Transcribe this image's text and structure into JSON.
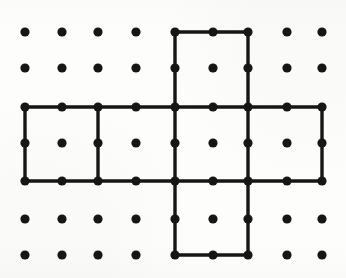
{
  "figure": {
    "caption": "",
    "background_color": "#fdfdfc",
    "ink_color": "#161616"
  },
  "chart_data": {
    "type": "scatter",
    "subtitle": "",
    "xlabel": "",
    "ylabel": "",
    "grid": false,
    "legend_position": "none",
    "xlim": [
      0,
      8
    ],
    "ylim": [
      0,
      6
    ],
    "axis_visible": false,
    "tick_labels_x": [],
    "tick_labels_y": [],
    "lattice": {
      "description": "Regular square lattice of filled round dots, 9 columns by 7 rows",
      "columns": 9,
      "rows": 7,
      "total_dots": 63,
      "dot_radius_px": 4.6,
      "dot_color": "#161616",
      "column_x_px": [
        25,
        62,
        98,
        136,
        175,
        213,
        248,
        287,
        322
      ],
      "row_y_px": [
        32,
        68,
        107,
        143,
        181,
        219,
        255
      ],
      "column_spacing_px": 37,
      "row_spacing_px": 37
    },
    "polygon": {
      "name": "cross-outline",
      "shape": "plus/cross (cube net)",
      "stroke_color": "#161616",
      "stroke_width_px": 3.4,
      "fill": "none",
      "closed": true,
      "vertices_grid": [
        [
          4,
          6
        ],
        [
          6,
          6
        ],
        [
          6,
          4
        ],
        [
          8,
          4
        ],
        [
          8,
          2
        ],
        [
          6,
          2
        ],
        [
          6,
          0
        ],
        [
          4,
          0
        ],
        [
          4,
          2
        ],
        [
          0,
          2
        ],
        [
          0,
          4
        ],
        [
          4,
          4
        ]
      ],
      "vertices_px": [
        [
          175,
          32
        ],
        [
          248,
          32
        ],
        [
          248,
          107
        ],
        [
          322,
          107
        ],
        [
          322,
          181
        ],
        [
          248,
          181
        ],
        [
          248,
          255
        ],
        [
          175,
          255
        ],
        [
          175,
          181
        ],
        [
          25,
          181
        ],
        [
          25,
          107
        ],
        [
          175,
          107
        ]
      ]
    },
    "internal_segments": {
      "description": "Segments dividing the cross into six unit squares",
      "stroke_color": "#161616",
      "stroke_width_px": 3.4,
      "segments_px": [
        [
          175,
          107,
          248,
          107
        ],
        [
          175,
          181,
          248,
          181
        ],
        [
          98,
          107,
          98,
          181
        ],
        [
          175,
          107,
          175,
          181
        ],
        [
          248,
          107,
          248,
          181
        ]
      ]
    },
    "cells": [
      {
        "name": "top-arm-square",
        "x_px": 175,
        "y_px": 32,
        "w_px": 73,
        "h_px": 75
      },
      {
        "name": "band-square-1",
        "x_px": 25,
        "y_px": 107,
        "w_px": 73,
        "h_px": 74
      },
      {
        "name": "band-square-2",
        "x_px": 98,
        "y_px": 107,
        "w_px": 77,
        "h_px": 74
      },
      {
        "name": "band-square-3",
        "x_px": 175,
        "y_px": 107,
        "w_px": 73,
        "h_px": 74
      },
      {
        "name": "band-square-4",
        "x_px": 248,
        "y_px": 107,
        "w_px": 74,
        "h_px": 74
      },
      {
        "name": "bottom-arm-square",
        "x_px": 175,
        "y_px": 181,
        "w_px": 73,
        "h_px": 74
      }
    ],
    "vertex_dots_on_polygon_px": [
      [
        175,
        32
      ],
      [
        213,
        32
      ],
      [
        248,
        32
      ],
      [
        175,
        68
      ],
      [
        248,
        68
      ],
      [
        25,
        107
      ],
      [
        62,
        107
      ],
      [
        98,
        107
      ],
      [
        136,
        107
      ],
      [
        175,
        107
      ],
      [
        213,
        107
      ],
      [
        248,
        107
      ],
      [
        287,
        107
      ],
      [
        322,
        107
      ],
      [
        25,
        143
      ],
      [
        98,
        143
      ],
      [
        175,
        143
      ],
      [
        248,
        143
      ],
      [
        322,
        143
      ],
      [
        25,
        181
      ],
      [
        62,
        181
      ],
      [
        98,
        181
      ],
      [
        136,
        181
      ],
      [
        175,
        181
      ],
      [
        213,
        181
      ],
      [
        248,
        181
      ],
      [
        287,
        181
      ],
      [
        322,
        181
      ],
      [
        175,
        219
      ],
      [
        248,
        219
      ],
      [
        175,
        255
      ],
      [
        213,
        255
      ],
      [
        248,
        255
      ]
    ]
  }
}
